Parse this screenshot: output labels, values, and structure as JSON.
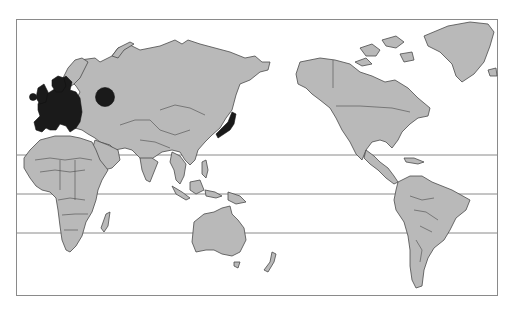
{
  "map": {
    "projection": "Pacific-centered world map",
    "colors": {
      "land": "#b9b9b9",
      "highlight": "#1a1a1a",
      "border": "#4a4a4a",
      "frame": "#8a8a8a",
      "water": "#ffffff"
    },
    "highlighted_regions": [
      "Europe",
      "Japan",
      "Western Russia (circle marker)"
    ],
    "latitude_lines": 3,
    "markers": [
      {
        "type": "circle",
        "region": "Western Russia",
        "color": "#1a1a1a"
      }
    ]
  }
}
